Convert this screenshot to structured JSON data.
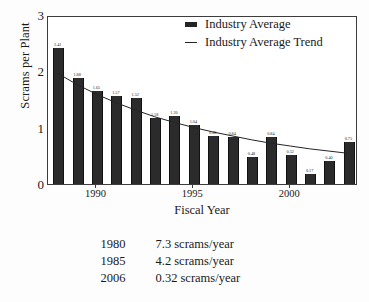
{
  "chart_data": {
    "type": "bar",
    "title": "",
    "xlabel": "Fiscal Year",
    "ylabel": "Scrams per Plant",
    "ylim": [
      0,
      3
    ],
    "yticks": [
      "0",
      "1",
      "2",
      "3"
    ],
    "xticks": [
      "1990",
      "1995",
      "2000"
    ],
    "xtick_years": [
      1990,
      1995,
      2000
    ],
    "grid": false,
    "legend_position": "top-right",
    "categories": [
      1988,
      1989,
      1990,
      1991,
      1992,
      1993,
      1994,
      1995,
      1996,
      1997,
      1998,
      1999,
      2000,
      2001,
      2002,
      2003
    ],
    "values": [
      2.41,
      1.88,
      1.65,
      1.57,
      1.52,
      1.18,
      1.2,
      1.04,
      0.86,
      0.84,
      0.48,
      0.84,
      0.52,
      0.17,
      0.4,
      0.75
    ],
    "data_labels": [
      "2.41",
      "1.88",
      "1.65",
      "1.57",
      "1.52",
      "1.18",
      "1.20",
      "1.04",
      "0.86",
      "0.84",
      "0.48",
      "0.84",
      "0.52",
      "0.17",
      "0.40",
      "0.75"
    ],
    "series": [
      {
        "name": "Industry Average",
        "type": "bar",
        "values": [
          2.41,
          1.88,
          1.65,
          1.57,
          1.52,
          1.18,
          1.2,
          1.04,
          0.86,
          0.84,
          0.48,
          0.84,
          0.52,
          0.17,
          0.4,
          0.75
        ]
      },
      {
        "name": "Industry Average Trend",
        "type": "line",
        "values": [
          2.0,
          1.8,
          1.63,
          1.48,
          1.35,
          1.23,
          1.13,
          1.04,
          0.96,
          0.89,
          0.82,
          0.76,
          0.71,
          0.66,
          0.62,
          0.58
        ]
      }
    ],
    "bar_color": "#2b2b2b",
    "line_color": "#242424"
  },
  "legend": {
    "items": [
      {
        "label": "Industry Average",
        "marker": "bar-swatch"
      },
      {
        "label": "Industry Average Trend",
        "marker": "line-swatch"
      }
    ]
  },
  "footnote": {
    "rows": [
      {
        "year": "1980",
        "value": "7.3 scrams/year"
      },
      {
        "year": "1985",
        "value": "4.2 scrams/year"
      },
      {
        "year": "2006",
        "value": "0.32 scrams/year"
      }
    ]
  }
}
